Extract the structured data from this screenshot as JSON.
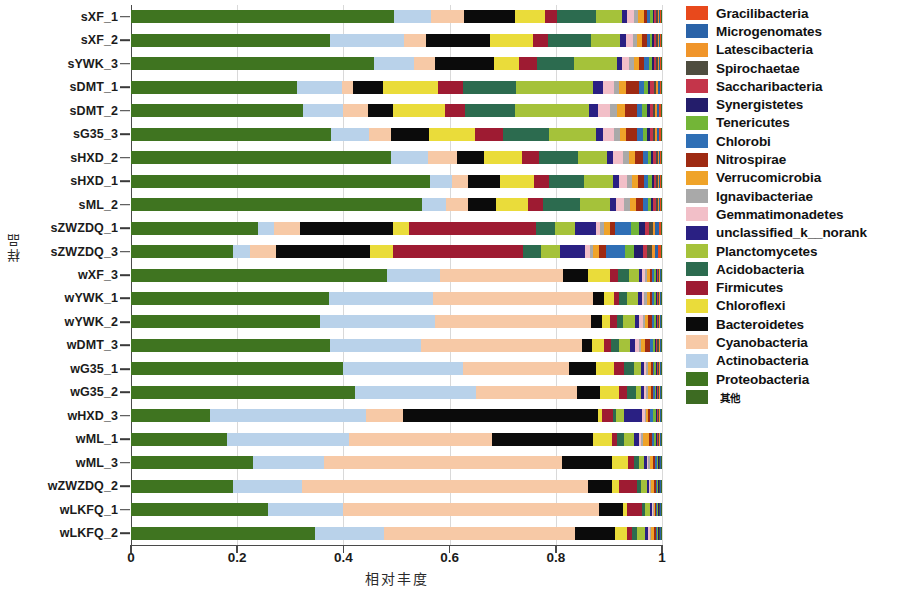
{
  "chart_data": {
    "type": "bar",
    "orientation": "horizontal",
    "stacked": true,
    "normalized": true,
    "title": "",
    "xlabel": "相对丰度",
    "ylabel": "样品",
    "xlim": [
      0,
      1
    ],
    "xticks": [
      "0",
      "0.2",
      "0.4",
      "0.6",
      "0.8",
      "1"
    ],
    "xtick_values": [
      0,
      0.2,
      0.4,
      0.6,
      0.8,
      1
    ],
    "grid": true,
    "legend_position": "right",
    "categories": [
      "sXF_1",
      "sXF_2",
      "sYWK_3",
      "sDMT_1",
      "sDMT_2",
      "sG35_3",
      "sHXD_2",
      "sHXD_1",
      "sML_2",
      "sZWZDQ_1",
      "sZWZDQ_3",
      "wXF_3",
      "wYWK_1",
      "wYWK_2",
      "wDMT_3",
      "wG35_1",
      "wG35_2",
      "wHXD_3",
      "wML_1",
      "wML_3",
      "wZWZDQ_2",
      "wLKFQ_1",
      "wLKFQ_2"
    ],
    "series": [
      {
        "name": "Proteobacteria",
        "color": "#3f7420",
        "values": [
          0.505,
          0.375,
          0.455,
          0.3,
          0.31,
          0.365,
          0.49,
          0.555,
          0.545,
          0.24,
          0.185,
          0.48,
          0.36,
          0.345,
          0.36,
          0.4,
          0.425,
          0.15,
          0.18,
          0.23,
          0.185,
          0.265,
          0.345
        ]
      },
      {
        "name": "Actinobacteria",
        "color": "#b9d2ea",
        "values": [
          0.072,
          0.14,
          0.075,
          0.082,
          0.072,
          0.07,
          0.07,
          0.04,
          0.045,
          0.03,
          0.03,
          0.1,
          0.19,
          0.21,
          0.165,
          0.225,
          0.23,
          0.295,
          0.23,
          0.135,
          0.125,
          0.145,
          0.13
        ]
      },
      {
        "name": "Cyanobacteria",
        "color": "#f7c9a6",
        "values": [
          0.063,
          0.042,
          0.04,
          0.02,
          0.045,
          0.04,
          0.055,
          0.03,
          0.04,
          0.048,
          0.048,
          0.23,
          0.29,
          0.285,
          0.29,
          0.2,
          0.19,
          0.07,
          0.27,
          0.45,
          0.52,
          0.495,
          0.36
        ]
      },
      {
        "name": "Bacteroidetes",
        "color": "#0b0b0b",
        "values": [
          0.098,
          0.12,
          0.11,
          0.055,
          0.045,
          0.07,
          0.05,
          0.06,
          0.052,
          0.175,
          0.17,
          0.048,
          0.02,
          0.02,
          0.018,
          0.05,
          0.045,
          0.37,
          0.19,
          0.095,
          0.045,
          0.045,
          0.075
        ]
      },
      {
        "name": "Chloroflexi",
        "color": "#eadc3a",
        "values": [
          0.058,
          0.08,
          0.048,
          0.1,
          0.095,
          0.085,
          0.073,
          0.062,
          0.06,
          0.03,
          0.042,
          0.04,
          0.018,
          0.015,
          0.022,
          0.035,
          0.035,
          0.008,
          0.035,
          0.03,
          0.012,
          0.008,
          0.022
        ]
      },
      {
        "name": "Firmicutes",
        "color": "#9e1b32",
        "values": [
          0.022,
          0.03,
          0.032,
          0.045,
          0.035,
          0.05,
          0.032,
          0.028,
          0.028,
          0.24,
          0.235,
          0.015,
          0.01,
          0.012,
          0.012,
          0.018,
          0.015,
          0.02,
          0.01,
          0.012,
          0.032,
          0.03,
          0.01
        ]
      },
      {
        "name": "Acidobacteria",
        "color": "#2c6b4f",
        "values": [
          0.075,
          0.08,
          0.07,
          0.095,
          0.09,
          0.085,
          0.072,
          0.065,
          0.07,
          0.035,
          0.032,
          0.022,
          0.015,
          0.012,
          0.015,
          0.02,
          0.018,
          0.005,
          0.012,
          0.008,
          0.008,
          0.005,
          0.01
        ]
      },
      {
        "name": "Planctomycetes",
        "color": "#a5c23a",
        "values": [
          0.05,
          0.055,
          0.08,
          0.14,
          0.135,
          0.085,
          0.055,
          0.055,
          0.055,
          0.038,
          0.035,
          0.018,
          0.02,
          0.022,
          0.02,
          0.012,
          0.01,
          0.016,
          0.02,
          0.01,
          0.01,
          0.01,
          0.014
        ]
      },
      {
        "name": "unclassified_k__norank",
        "color": "#2a2083",
        "values": [
          0.01,
          0.012,
          0.01,
          0.018,
          0.016,
          0.014,
          0.012,
          0.01,
          0.012,
          0.04,
          0.045,
          0.006,
          0.006,
          0.008,
          0.01,
          0.006,
          0.005,
          0.035,
          0.008,
          0.005,
          0.004,
          0.003,
          0.006
        ]
      },
      {
        "name": "Gemmatimonadetes",
        "color": "#f2bfc8",
        "values": [
          0.014,
          0.013,
          0.014,
          0.02,
          0.022,
          0.02,
          0.018,
          0.015,
          0.016,
          0.008,
          0.008,
          0.005,
          0.005,
          0.006,
          0.006,
          0.004,
          0.004,
          0.004,
          0.005,
          0.003,
          0.003,
          0.002,
          0.003
        ]
      },
      {
        "name": "Ignavibacteriae",
        "color": "#a9a9a9",
        "values": [
          0.008,
          0.007,
          0.008,
          0.01,
          0.012,
          0.01,
          0.012,
          0.01,
          0.01,
          0.006,
          0.006,
          0.004,
          0.004,
          0.004,
          0.004,
          0.003,
          0.003,
          0.003,
          0.004,
          0.003,
          0.002,
          0.002,
          0.003
        ]
      },
      {
        "name": "Verrucomicrobia",
        "color": "#efa329",
        "values": [
          0.01,
          0.01,
          0.01,
          0.012,
          0.014,
          0.012,
          0.012,
          0.01,
          0.012,
          0.012,
          0.012,
          0.006,
          0.006,
          0.006,
          0.008,
          0.006,
          0.006,
          0.004,
          0.01,
          0.006,
          0.004,
          0.003,
          0.005
        ]
      },
      {
        "name": "Nitrospirae",
        "color": "#9e2a12",
        "values": [
          0.006,
          0.008,
          0.01,
          0.024,
          0.022,
          0.02,
          0.014,
          0.012,
          0.012,
          0.01,
          0.012,
          0.004,
          0.004,
          0.006,
          0.008,
          0.004,
          0.004,
          0.003,
          0.006,
          0.004,
          0.004,
          0.002,
          0.003
        ]
      },
      {
        "name": "Chlorobi",
        "color": "#2f6fb5",
        "values": [
          0.006,
          0.006,
          0.008,
          0.008,
          0.01,
          0.01,
          0.01,
          0.008,
          0.01,
          0.03,
          0.035,
          0.004,
          0.004,
          0.004,
          0.006,
          0.003,
          0.003,
          0.006,
          0.004,
          0.003,
          0.002,
          0.002,
          0.003
        ]
      },
      {
        "name": "Tenericutes",
        "color": "#73b537",
        "values": [
          0.005,
          0.005,
          0.006,
          0.008,
          0.008,
          0.008,
          0.006,
          0.006,
          0.006,
          0.014,
          0.016,
          0.003,
          0.003,
          0.004,
          0.004,
          0.003,
          0.003,
          0.005,
          0.004,
          0.002,
          0.002,
          0.002,
          0.002
        ]
      },
      {
        "name": "Synergistetes",
        "color": "#241d6b",
        "values": [
          0.003,
          0.003,
          0.004,
          0.004,
          0.005,
          0.005,
          0.004,
          0.004,
          0.004,
          0.012,
          0.015,
          0.002,
          0.002,
          0.002,
          0.002,
          0.002,
          0.002,
          0.002,
          0.002,
          0.002,
          0.001,
          0.001,
          0.001
        ]
      },
      {
        "name": "Saccharibacteria",
        "color": "#c4354a",
        "values": [
          0.004,
          0.004,
          0.004,
          0.006,
          0.006,
          0.006,
          0.005,
          0.004,
          0.005,
          0.008,
          0.008,
          0.002,
          0.002,
          0.002,
          0.002,
          0.002,
          0.002,
          0.002,
          0.002,
          0.001,
          0.001,
          0.001,
          0.001
        ]
      },
      {
        "name": "Spirochaetae",
        "color": "#4e4d3f",
        "values": [
          0.003,
          0.003,
          0.003,
          0.004,
          0.004,
          0.004,
          0.003,
          0.003,
          0.003,
          0.008,
          0.01,
          0.002,
          0.002,
          0.002,
          0.002,
          0.002,
          0.002,
          0.002,
          0.002,
          0.001,
          0.001,
          0.001,
          0.001
        ]
      },
      {
        "name": "Latescibacteria",
        "color": "#f0952a",
        "values": [
          0.003,
          0.003,
          0.003,
          0.004,
          0.004,
          0.004,
          0.003,
          0.003,
          0.003,
          0.004,
          0.004,
          0.002,
          0.002,
          0.002,
          0.002,
          0.002,
          0.002,
          0.002,
          0.002,
          0.001,
          0.001,
          0.001,
          0.001
        ]
      },
      {
        "name": "Microgenomates",
        "color": "#2a63a8",
        "values": [
          0.002,
          0.002,
          0.002,
          0.003,
          0.003,
          0.003,
          0.002,
          0.002,
          0.002,
          0.006,
          0.006,
          0.001,
          0.001,
          0.001,
          0.002,
          0.001,
          0.001,
          0.002,
          0.001,
          0.001,
          0.001,
          0.001,
          0.001
        ]
      },
      {
        "name": "Gracilibacteria",
        "color": "#e8491c",
        "values": [
          0.002,
          0.002,
          0.002,
          0.002,
          0.003,
          0.003,
          0.002,
          0.002,
          0.002,
          0.004,
          0.005,
          0.001,
          0.001,
          0.001,
          0.001,
          0.001,
          0.001,
          0.001,
          0.001,
          0.001,
          0.001,
          0.001,
          0.001
        ]
      },
      {
        "name": "其他",
        "color": "#3d6b22",
        "values": [
          0.001,
          0.001,
          0.001,
          0.002,
          0.002,
          0.002,
          0.001,
          0.001,
          0.001,
          0.002,
          0.002,
          0.001,
          0.001,
          0.001,
          0.001,
          0.001,
          0.001,
          0.001,
          0.001,
          0.001,
          0.001,
          0.001,
          0.001
        ]
      }
    ]
  },
  "axes": {
    "y_title": "样品",
    "x_title": "相对丰度",
    "x_ticks": [
      "0",
      "0.2",
      "0.4",
      "0.6",
      "0.8",
      "1"
    ]
  },
  "legend": {
    "items": [
      {
        "label": "Gracilibacteria",
        "color": "#e8491c"
      },
      {
        "label": "Microgenomates",
        "color": "#2a63a8"
      },
      {
        "label": "Latescibacteria",
        "color": "#f0952a"
      },
      {
        "label": "Spirochaetae",
        "color": "#4e4d3f"
      },
      {
        "label": "Saccharibacteria",
        "color": "#c4354a"
      },
      {
        "label": "Synergistetes",
        "color": "#241d6b"
      },
      {
        "label": "Tenericutes",
        "color": "#73b537"
      },
      {
        "label": "Chlorobi",
        "color": "#2f6fb5"
      },
      {
        "label": "Nitrospirae",
        "color": "#9e2a12"
      },
      {
        "label": "Verrucomicrobia",
        "color": "#efa329"
      },
      {
        "label": "Ignavibacteriae",
        "color": "#a9a9a9"
      },
      {
        "label": "Gemmatimonadetes",
        "color": "#f2bfc8"
      },
      {
        "label": "unclassified_k__norank",
        "color": "#2a2083"
      },
      {
        "label": "Planctomycetes",
        "color": "#a5c23a"
      },
      {
        "label": "Acidobacteria",
        "color": "#2c6b4f"
      },
      {
        "label": "Firmicutes",
        "color": "#9e1b32"
      },
      {
        "label": "Chloroflexi",
        "color": "#eadc3a"
      },
      {
        "label": "Bacteroidetes",
        "color": "#0b0b0b"
      },
      {
        "label": "Cyanobacteria",
        "color": "#f7c9a6"
      },
      {
        "label": "Actinobacteria",
        "color": "#b9d2ea"
      },
      {
        "label": "Proteobacteria",
        "color": "#3f7420"
      },
      {
        "label": "其他",
        "color": "#3d6b22"
      }
    ]
  }
}
